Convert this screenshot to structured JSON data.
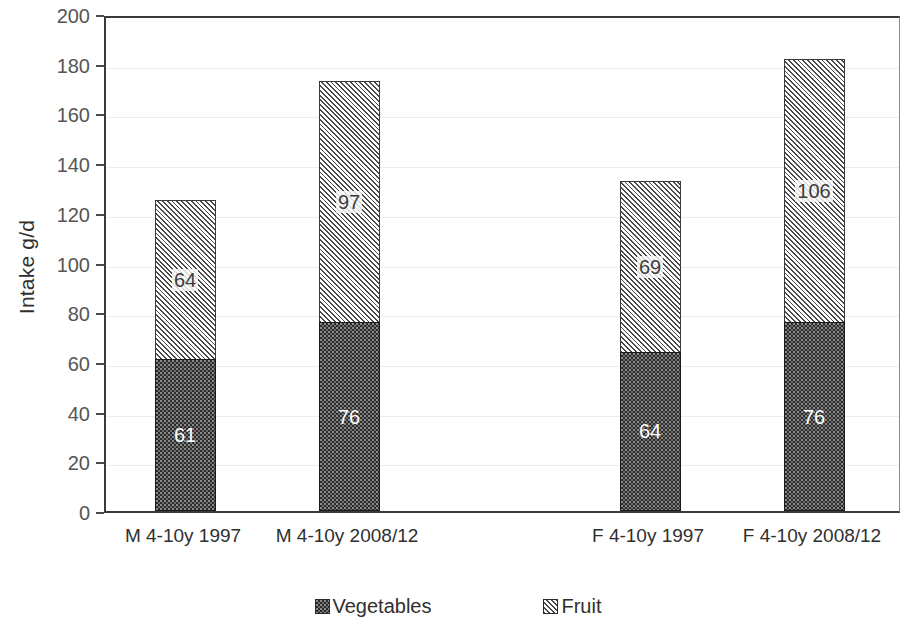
{
  "chart_data": {
    "type": "bar",
    "subtype": "stacked",
    "title": "",
    "xlabel": "",
    "ylabel": "Intake g/d",
    "ylim": [
      0,
      200
    ],
    "ytick_step": 20,
    "yticks": [
      0,
      20,
      40,
      60,
      80,
      100,
      120,
      140,
      160,
      180,
      200
    ],
    "ytick_labels": [
      "0",
      "20",
      "40",
      "60",
      "80",
      "100",
      "120",
      "140",
      "160",
      "180",
      "200"
    ],
    "grid": true,
    "grid_axis": "y",
    "legend_position": "bottom",
    "categories": [
      "M 4-10y 1997",
      "M 4-10y 2008/12",
      "F 4-10y 1997",
      "F 4-10y 2008/12"
    ],
    "series": [
      {
        "name": "Vegetables",
        "values": [
          61,
          76,
          64,
          76
        ],
        "labels": [
          "61",
          "76",
          "64",
          "76"
        ],
        "color": "#2b2b2b",
        "pattern": "dotted-fill"
      },
      {
        "name": "Fruit",
        "values": [
          64,
          97,
          69,
          106
        ],
        "labels": [
          "64",
          "97",
          "69",
          "106"
        ],
        "color": "#fbfbfb",
        "pattern": "diagonal-hatch"
      }
    ],
    "totals": [
      125,
      173,
      133,
      182
    ]
  },
  "legend": {
    "items": [
      {
        "label": "Vegetables",
        "swatch": "veg"
      },
      {
        "label": "Fruit",
        "swatch": "fruit"
      }
    ]
  }
}
